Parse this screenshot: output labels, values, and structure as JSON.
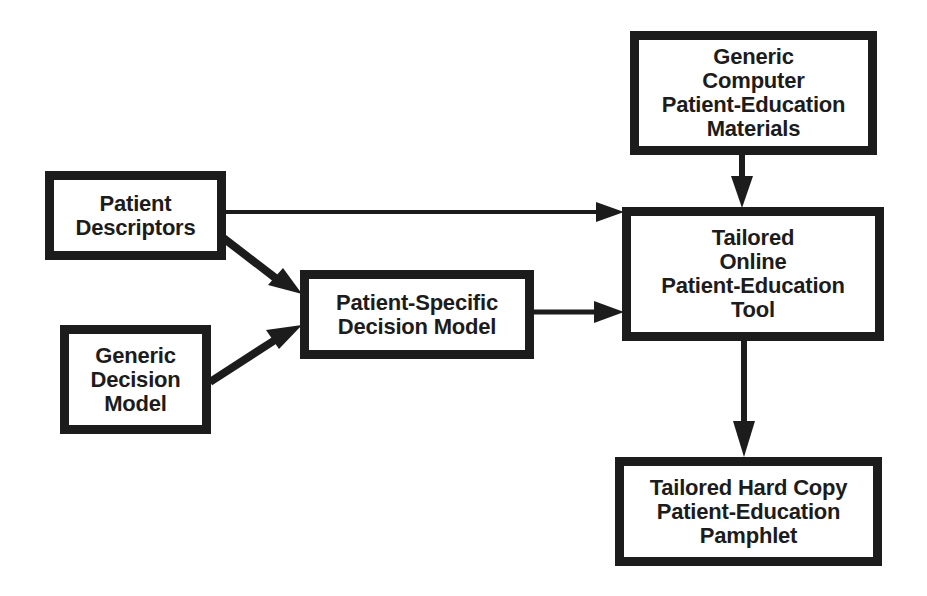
{
  "diagram": {
    "nodes": [
      {
        "id": "patient_descriptors",
        "lines": [
          "Patient",
          "Descriptors"
        ]
      },
      {
        "id": "generic_decision_model",
        "lines": [
          "Generic",
          "Decision",
          "Model"
        ]
      },
      {
        "id": "patient_specific_decision_model",
        "lines": [
          "Patient-Specific",
          "Decision Model"
        ]
      },
      {
        "id": "generic_computer_materials",
        "lines": [
          "Generic",
          "Computer",
          "Patient-Education",
          "Materials"
        ]
      },
      {
        "id": "tailored_online_tool",
        "lines": [
          "Tailored",
          "Online",
          "Patient-Education",
          "Tool"
        ]
      },
      {
        "id": "tailored_hard_copy",
        "lines": [
          "Tailored Hard Copy",
          "Patient-Education",
          "Pamphlet"
        ]
      }
    ],
    "edges": [
      {
        "from": "patient_descriptors",
        "to": "tailored_online_tool"
      },
      {
        "from": "patient_descriptors",
        "to": "patient_specific_decision_model"
      },
      {
        "from": "generic_decision_model",
        "to": "patient_specific_decision_model"
      },
      {
        "from": "patient_specific_decision_model",
        "to": "tailored_online_tool"
      },
      {
        "from": "generic_computer_materials",
        "to": "tailored_online_tool"
      },
      {
        "from": "tailored_online_tool",
        "to": "tailored_hard_copy"
      }
    ],
    "colors": {
      "stroke": "#1c1c1c",
      "background": "#ffffff"
    }
  }
}
